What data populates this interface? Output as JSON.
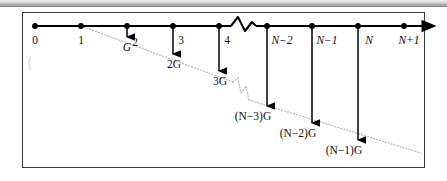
{
  "figure": {
    "kind": "number-line-diagram",
    "border_color": "#3a3a3a",
    "axis_color": "#000000",
    "dotted_line_color": "#b9b9b9",
    "background": "#ffffff"
  },
  "axis": {
    "name": "horizontal-number-line",
    "has_end_arrow": true,
    "break_symbol": "zigzag",
    "ticks": [
      {
        "id": "tick-0",
        "label": "0",
        "x": 35,
        "italic": false,
        "has_drop_arrow": false
      },
      {
        "id": "tick-1",
        "label": "1",
        "x": 81,
        "italic": false,
        "has_drop_arrow": false
      },
      {
        "id": "tick-2",
        "label": "2",
        "x": 127,
        "italic": false,
        "has_drop_arrow": true
      },
      {
        "id": "tick-3",
        "label": "3",
        "x": 173,
        "italic": false,
        "has_drop_arrow": true
      },
      {
        "id": "tick-4",
        "label": "4",
        "x": 219,
        "italic": false,
        "has_drop_arrow": true
      },
      {
        "id": "tick-n-2",
        "label": "N−2",
        "x": 267,
        "italic": true,
        "has_drop_arrow": true
      },
      {
        "id": "tick-n-1",
        "label": "N−1",
        "x": 312,
        "italic": true,
        "has_drop_arrow": true
      },
      {
        "id": "tick-n",
        "label": "N",
        "x": 358,
        "italic": true,
        "has_drop_arrow": true
      },
      {
        "id": "tick-n+1",
        "label": "N+1",
        "x": 404,
        "italic": true,
        "has_drop_arrow": false
      }
    ]
  },
  "drops": [
    {
      "id": "drop-g",
      "label": "G",
      "from_tick": "tick-2",
      "x": 127,
      "tip_y": 37,
      "label_x": 127,
      "label_y": 51
    },
    {
      "id": "drop-2g",
      "label": "2G",
      "from_tick": "tick-3",
      "x": 173,
      "tip_y": 54,
      "label_x": 174,
      "label_y": 68
    },
    {
      "id": "drop-3g",
      "label": "3G",
      "from_tick": "tick-4",
      "x": 219,
      "tip_y": 71,
      "label_x": 220,
      "label_y": 85
    },
    {
      "id": "drop-n-3g",
      "label": "(N−3)G",
      "from_tick": "tick-n-2",
      "x": 267,
      "tip_y": 106,
      "label_x": 253,
      "label_y": 120
    },
    {
      "id": "drop-n-2g",
      "label": "(N−2)G",
      "from_tick": "tick-n-1",
      "x": 312,
      "tip_y": 123,
      "label_x": 298,
      "label_y": 137
    },
    {
      "id": "drop-n-1g",
      "label": "(N−1)G",
      "from_tick": "tick-n",
      "x": 358,
      "tip_y": 140,
      "label_x": 344,
      "label_y": 154
    }
  ],
  "dotted_line": {
    "name": "envelope-line",
    "start": {
      "x": 81,
      "y": 26
    },
    "end": {
      "x": 421,
      "y": 153
    },
    "has_break": true,
    "break_x": 240
  }
}
